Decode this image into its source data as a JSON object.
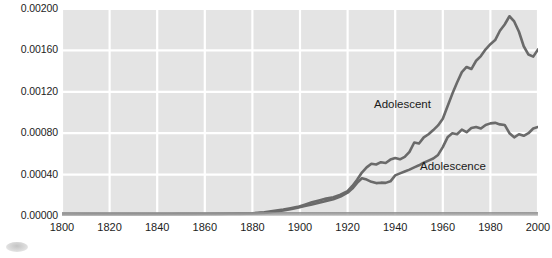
{
  "chart_data": {
    "type": "line",
    "title": "",
    "xlabel": "",
    "ylabel": "",
    "xlim": [
      1800,
      2000
    ],
    "ylim": [
      0.0,
      0.002
    ],
    "grid": true,
    "legend_position": "inline-annotation",
    "x_tick_labels": [
      "1800",
      "1820",
      "1840",
      "1860",
      "1880",
      "1900",
      "1920",
      "1940",
      "1960",
      "1980",
      "2000"
    ],
    "x_ticks": [
      1800,
      1820,
      1840,
      1860,
      1880,
      1900,
      1920,
      1940,
      1960,
      1980,
      2000
    ],
    "y_tick_labels": [
      "0.00200",
      "0.00160",
      "0.00120",
      "0.00080",
      "0.00040",
      "0.00000"
    ],
    "y_ticks": [
      0.002,
      0.0016,
      0.0012,
      0.0008,
      0.0004,
      0.0
    ],
    "colors": {
      "line": "#6a6a6a",
      "plot_background": "#e4e4e4",
      "gridline": "#ffffff",
      "text": "#1d1d1d"
    },
    "annotations": [
      {
        "text": "Adolescent",
        "x": 1940,
        "y": 0.00113
      },
      {
        "text": "Adolescence",
        "x": 1959,
        "y": 0.00054
      }
    ],
    "series": [
      {
        "name": "Adolescent",
        "x": [
          1800,
          1805,
          1810,
          1815,
          1820,
          1825,
          1830,
          1835,
          1840,
          1845,
          1850,
          1855,
          1860,
          1865,
          1870,
          1875,
          1880,
          1885,
          1890,
          1893,
          1896,
          1899,
          1902,
          1905,
          1908,
          1911,
          1914,
          1917,
          1920,
          1922,
          1924,
          1926,
          1928,
          1930,
          1932,
          1934,
          1936,
          1938,
          1940,
          1942,
          1944,
          1946,
          1948,
          1950,
          1952,
          1954,
          1956,
          1958,
          1960,
          1962,
          1964,
          1966,
          1968,
          1970,
          1972,
          1974,
          1976,
          1978,
          1980,
          1982,
          1984,
          1986,
          1988,
          1990,
          1992,
          1994,
          1996,
          1998,
          2000
        ],
        "y": [
          1.2e-05,
          1.2e-05,
          1.3e-05,
          1.3e-05,
          1.4e-05,
          1.4e-05,
          1.5e-05,
          1.5e-05,
          1.6e-05,
          1.7e-05,
          1.8e-05,
          1.8e-05,
          1.9e-05,
          2e-05,
          2.2e-05,
          2.4e-05,
          2.7e-05,
          3.5e-05,
          5.2e-05,
          6.2e-05,
          7.5e-05,
          8.8e-05,
          0.00011,
          0.000132,
          0.00015,
          0.000168,
          0.000182,
          0.000205,
          0.00024,
          0.00029,
          0.00035,
          0.00042,
          0.00047,
          0.000505,
          0.000498,
          0.00052,
          0.000512,
          0.000545,
          0.00056,
          0.000548,
          0.000572,
          0.00062,
          0.00071,
          0.0007,
          0.00076,
          0.00079,
          0.00083,
          0.000875,
          0.00094,
          0.00106,
          0.00118,
          0.00129,
          0.00139,
          0.00144,
          0.00142,
          0.0015,
          0.001545,
          0.00161,
          0.00166,
          0.0017,
          0.00179,
          0.00185,
          0.00193,
          0.00188,
          0.00178,
          0.00164,
          0.00156,
          0.00154,
          0.00161
        ]
      },
      {
        "name": "Adolescence",
        "x": [
          1800,
          1805,
          1810,
          1815,
          1820,
          1825,
          1830,
          1835,
          1840,
          1845,
          1850,
          1855,
          1860,
          1865,
          1870,
          1875,
          1880,
          1885,
          1890,
          1893,
          1896,
          1899,
          1902,
          1905,
          1908,
          1911,
          1914,
          1917,
          1920,
          1922,
          1924,
          1926,
          1928,
          1930,
          1932,
          1934,
          1936,
          1938,
          1940,
          1942,
          1944,
          1946,
          1948,
          1950,
          1952,
          1954,
          1956,
          1958,
          1960,
          1962,
          1964,
          1966,
          1968,
          1970,
          1972,
          1974,
          1976,
          1978,
          1980,
          1982,
          1984,
          1986,
          1988,
          1990,
          1992,
          1994,
          1996,
          1998,
          2000
        ],
        "y": [
          1e-05,
          1e-05,
          1.1e-05,
          1.1e-05,
          1.2e-05,
          1.2e-05,
          1.3e-05,
          1.3e-05,
          1.4e-05,
          1.5e-05,
          1.6e-05,
          1.6e-05,
          1.7e-05,
          1.8e-05,
          1.9e-05,
          2.1e-05,
          2.4e-05,
          3e-05,
          4.4e-05,
          5.4e-05,
          6.6e-05,
          8e-05,
          9.6e-05,
          0.000112,
          0.000128,
          0.000146,
          0.000162,
          0.000188,
          0.000225,
          0.000265,
          0.00032,
          0.000365,
          0.000352,
          0.00033,
          0.000318,
          0.000322,
          0.00032,
          0.000335,
          0.000392,
          0.000412,
          0.00043,
          0.000448,
          0.00047,
          0.00049,
          0.000515,
          0.000535,
          0.000555,
          0.00059,
          0.000665,
          0.00076,
          0.0008,
          0.00079,
          0.000835,
          0.00081,
          0.00085,
          0.00086,
          0.000845,
          0.00088,
          0.000895,
          0.0009,
          0.000885,
          0.00088,
          0.0008,
          0.00076,
          0.00079,
          0.000775,
          0.0008,
          0.000845,
          0.00086
        ]
      }
    ]
  }
}
